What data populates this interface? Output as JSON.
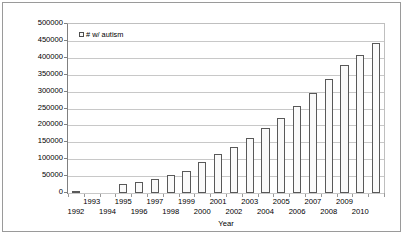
{
  "chart_data": {
    "type": "bar",
    "title": "",
    "xlabel": "Year",
    "ylabel": "Number of children with autism (served by IDEA)",
    "legend": [
      {
        "label": "# w/ autism",
        "marker": "empty-square",
        "color": "#fafafa"
      }
    ],
    "legend_position": "top-left-inside",
    "grid": true,
    "ylim": [
      0,
      500000
    ],
    "ytick_step": 50000,
    "ytick_labels": [
      "500000",
      "450000",
      "400000",
      "350000",
      "300000",
      "250000",
      "200000",
      "150000",
      "100000",
      "50000",
      "0"
    ],
    "categories": [
      "1992",
      "1993",
      "1994",
      "1995",
      "1996",
      "1997",
      "1998",
      "1999",
      "2000",
      "2001",
      "2002",
      "2003",
      "2004",
      "2005",
      "2006",
      "2007",
      "2008",
      "2009",
      "2010",
      "2011"
    ],
    "xtick_labels_shown": [
      "1992",
      "1993",
      "1994",
      "1995",
      "1996",
      "1997",
      "1998",
      "1999",
      "2000",
      "2001",
      "2002",
      "2003",
      "2004",
      "2005",
      "2006",
      "2007",
      "2008",
      "2009",
      "2010"
    ],
    "values": [
      5000,
      0,
      0,
      28000,
      33000,
      42000,
      53000,
      65000,
      93000,
      114000,
      137000,
      163000,
      192000,
      223000,
      258000,
      297000,
      337000,
      379000,
      408000,
      445000
    ],
    "series": [
      {
        "name": "# w/ autism",
        "values": [
          5000,
          0,
          0,
          28000,
          33000,
          42000,
          53000,
          65000,
          93000,
          114000,
          137000,
          163000,
          192000,
          223000,
          258000,
          297000,
          337000,
          379000,
          408000,
          445000
        ]
      }
    ],
    "colors": {
      "bar_fill": "#fafafa",
      "bar_stroke": "#595959",
      "gridline": "#c8c8c8",
      "axis": "#808080",
      "text": "#000000",
      "background": "#ffffff",
      "frame": "#9a9a9a"
    }
  }
}
